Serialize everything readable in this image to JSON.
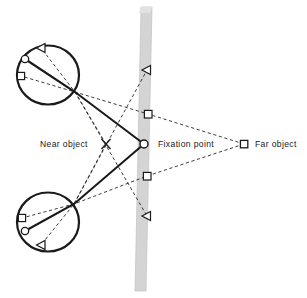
{
  "figure": {
    "type": "optical-ray-diagram",
    "background_color": "#ffffff",
    "width": 307,
    "height": 298
  },
  "labels": {
    "near_object": "Near object",
    "fixation_point": "Fixation point",
    "far_object": "Far object"
  },
  "colors": {
    "ink": "#1a1a1a",
    "screen_fill": "#d4d4d4",
    "screen_edge": "#bdbdbd",
    "marker_fill": "#ffffff"
  },
  "objects": [
    {
      "name": "near-object",
      "marker": "x-cross",
      "x": 106,
      "y": 144,
      "label": "Near object"
    },
    {
      "name": "fixation-point",
      "marker": "circle",
      "x": 144,
      "y": 144,
      "label": "Fixation point"
    },
    {
      "name": "far-object",
      "marker": "square",
      "x": 244,
      "y": 144,
      "label": "Far object"
    }
  ],
  "eyes": [
    {
      "name": "upper-eye",
      "center_x": 48,
      "center_y": 75,
      "radius": 30,
      "nodal_point_x": 75,
      "nodal_point_y": 92,
      "retinal_markers": [
        {
          "name": "triangle-image",
          "marker": "triangle-left",
          "x": 41,
          "y": 48
        },
        {
          "name": "circle-image",
          "marker": "circle",
          "x": 25,
          "y": 59
        },
        {
          "name": "square-image",
          "marker": "square",
          "x": 21,
          "y": 76
        }
      ]
    },
    {
      "name": "lower-eye",
      "center_x": 48,
      "center_y": 222,
      "radius": 30,
      "nodal_point_x": 74,
      "nodal_point_y": 204,
      "retinal_markers": [
        {
          "name": "square-image",
          "marker": "square",
          "x": 22,
          "y": 218
        },
        {
          "name": "circle-image",
          "marker": "circle",
          "x": 25,
          "y": 231
        },
        {
          "name": "triangle-image",
          "marker": "triangle-left",
          "x": 41,
          "y": 245
        }
      ]
    }
  ],
  "screen": {
    "name": "vertical-screen-plane",
    "top_left_x": 135,
    "top_y": 7,
    "bottom_y": 291,
    "width": 17,
    "slant_px": 6,
    "fill": "#d4d4d4"
  },
  "screen_markers": [
    {
      "name": "upper-triangle-marker",
      "marker": "triangle-left",
      "x": 147,
      "y": 70
    },
    {
      "name": "upper-square-marker",
      "marker": "square",
      "x": 148,
      "y": 114
    },
    {
      "name": "lower-square-marker",
      "marker": "square",
      "x": 147,
      "y": 176
    },
    {
      "name": "lower-triangle-marker",
      "marker": "triangle-left",
      "x": 147,
      "y": 216
    }
  ],
  "rays": {
    "solid_description": "Fixation point to both nodal points and through to retina",
    "dashed_description": "Near object and far object rays, plus projection lines to screen"
  }
}
